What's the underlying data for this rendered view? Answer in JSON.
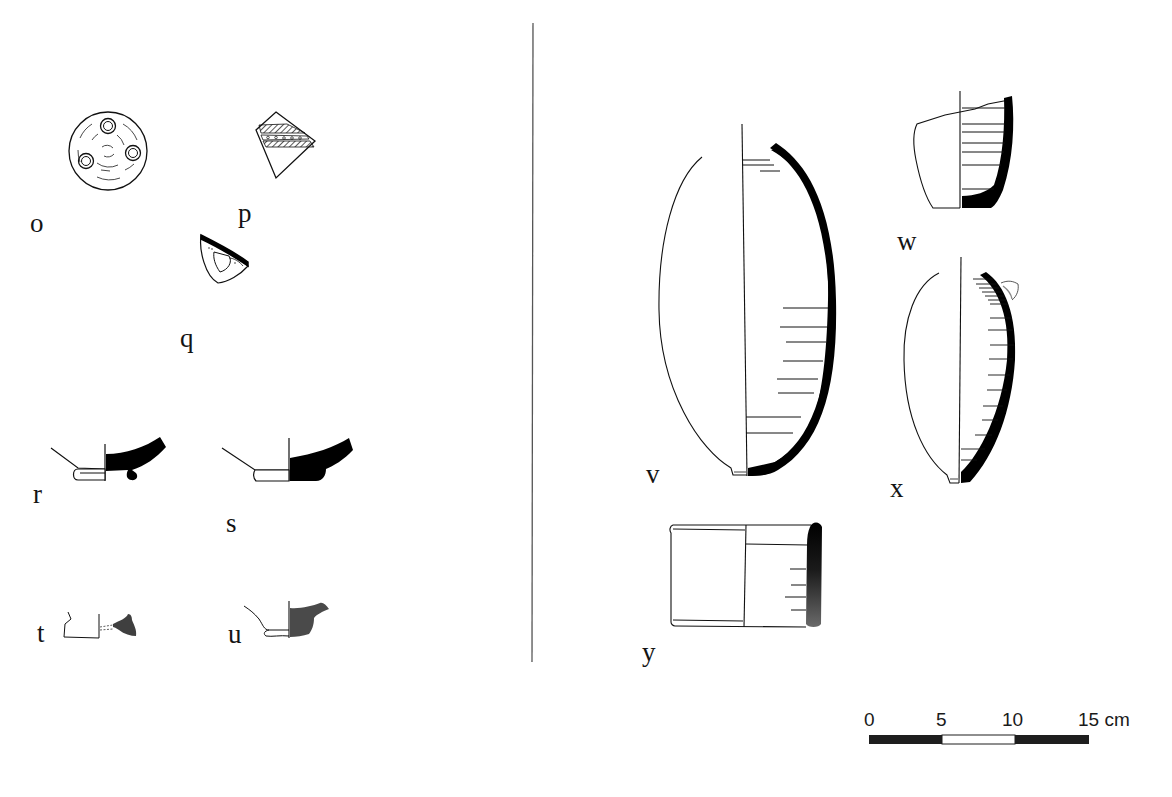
{
  "figure": {
    "type": "archaeological pottery drawing plate",
    "background": "#ffffff",
    "ink_color": "#111111",
    "section_fill_dark": "#000000",
    "section_fill_gray": "#4a4a4a"
  },
  "divider": {
    "x": 533,
    "y1": 23,
    "y2": 662
  },
  "objects": [
    {
      "id": "o",
      "label": "o",
      "description": "circular disc with three ring impressions and concentric incised dashes",
      "label_pos": [
        30,
        232
      ]
    },
    {
      "id": "p",
      "label": "p",
      "description": "decorated body sherd with hatched and dotted bands",
      "label_pos": [
        238,
        222
      ]
    },
    {
      "id": "q",
      "label": "q",
      "description": "small fragment with black rim band and triangular opening",
      "label_pos": [
        180,
        347
      ]
    },
    {
      "id": "r",
      "label": "r",
      "description": "ring-footed base profile, black section",
      "label_pos": [
        33,
        503
      ]
    },
    {
      "id": "s",
      "label": "s",
      "description": "ring-footed base profile, black section",
      "label_pos": [
        226,
        532
      ]
    },
    {
      "id": "t",
      "label": "t",
      "description": "small base fragment, gray section",
      "label_pos": [
        37,
        642
      ]
    },
    {
      "id": "u",
      "label": "u",
      "description": "base fragment, gray section",
      "label_pos": [
        228,
        643
      ]
    },
    {
      "id": "v",
      "label": "v",
      "description": "tall ovoid closed vessel, half-section profile",
      "label_pos": [
        646,
        483
      ]
    },
    {
      "id": "w",
      "label": "w",
      "description": "cup fragment with thick walls, half-section",
      "label_pos": [
        897,
        250
      ]
    },
    {
      "id": "x",
      "label": "x",
      "description": "ovoid vessel with small lug near rim, half-section",
      "label_pos": [
        890,
        497
      ]
    },
    {
      "id": "y",
      "label": "y",
      "description": "cylindrical vessel with gradient-shaded wall section",
      "label_pos": [
        642,
        661
      ]
    }
  ],
  "scale_bar": {
    "ticks": [
      "0",
      "5",
      "10",
      "15 cm"
    ],
    "unit": "cm",
    "segments": [
      {
        "from": 0,
        "to": 5,
        "fill": "#1e1e1e"
      },
      {
        "from": 5,
        "to": 10,
        "fill": "#ffffff"
      },
      {
        "from": 10,
        "to": 15,
        "fill": "#1e1e1e"
      }
    ],
    "x_start": 869,
    "x_end": 1089,
    "y": 735,
    "height": 9
  }
}
